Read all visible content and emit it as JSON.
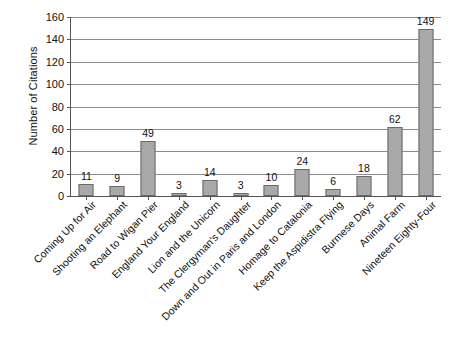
{
  "chart_data": {
    "type": "bar",
    "title": "",
    "xlabel": "",
    "ylabel": "Number of Citations",
    "ylim": [
      0,
      160
    ],
    "ytick_step": 20,
    "yticks": [
      0,
      20,
      40,
      60,
      80,
      100,
      120,
      140,
      160
    ],
    "grid": true,
    "legend": false,
    "bar_color": "#a9a9a9",
    "bar_border_color": "#6a6a6a",
    "categories": [
      "Coming Up for Air",
      "Shooting an Elephant",
      "Road to Wigan Pier",
      "England Your England",
      "Lion and the Unicorn",
      "The Clergyman's Daughter",
      "Down and Out in Paris and London",
      "Homage to Catalonia",
      "Keep the Aspidistra Flying",
      "Burmese Days",
      "Animal Farm",
      "Nineteen Eighty-Four"
    ],
    "values": [
      11,
      9,
      49,
      3,
      14,
      3,
      10,
      24,
      6,
      18,
      62,
      149
    ],
    "data_labels": [
      "11",
      "9",
      "49",
      "3",
      "14",
      "3",
      "10",
      "24",
      "6",
      "18",
      "62",
      "149"
    ]
  }
}
